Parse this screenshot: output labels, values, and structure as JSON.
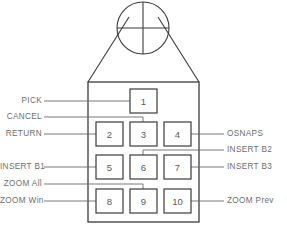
{
  "diagram": {
    "colors": {
      "outline": "#3b3b3b",
      "leader": "#6a6a6a",
      "text": "#6d6d6d",
      "key_text": "#5a5a5a",
      "background": "#ffffff"
    },
    "puck": {
      "crosshair_name": "crosshair-reticle"
    },
    "keys": [
      {
        "id": "key-1",
        "label": "1",
        "x": 130,
        "y": 89,
        "w": 27,
        "h": 24
      },
      {
        "id": "key-2",
        "label": "2",
        "x": 96,
        "y": 122,
        "w": 27,
        "h": 24
      },
      {
        "id": "key-3",
        "label": "3",
        "x": 130,
        "y": 122,
        "w": 27,
        "h": 24
      },
      {
        "id": "key-4",
        "label": "4",
        "x": 164,
        "y": 122,
        "w": 27,
        "h": 24
      },
      {
        "id": "key-5",
        "label": "5",
        "x": 96,
        "y": 155,
        "w": 27,
        "h": 24
      },
      {
        "id": "key-6",
        "label": "6",
        "x": 130,
        "y": 155,
        "w": 27,
        "h": 24
      },
      {
        "id": "key-7",
        "label": "7",
        "x": 164,
        "y": 155,
        "w": 27,
        "h": 24
      },
      {
        "id": "key-8",
        "label": "8",
        "x": 96,
        "y": 189,
        "w": 27,
        "h": 24
      },
      {
        "id": "key-9",
        "label": "9",
        "x": 130,
        "y": 189,
        "w": 27,
        "h": 24
      },
      {
        "id": "key-10",
        "label": "10",
        "x": 164,
        "y": 189,
        "w": 27,
        "h": 24
      }
    ],
    "callouts": [
      {
        "id": "callout-pick",
        "text": "PICK",
        "side": "left",
        "key": "1"
      },
      {
        "id": "callout-cancel",
        "text": "CANCEL",
        "side": "left",
        "key": "3"
      },
      {
        "id": "callout-return",
        "text": "RETURN",
        "side": "left",
        "key": "2"
      },
      {
        "id": "callout-insert-b1",
        "text": "INSERT  B1",
        "side": "left",
        "key": "5"
      },
      {
        "id": "callout-zoom-all",
        "text": "ZOOM  All",
        "side": "left",
        "key": "9"
      },
      {
        "id": "callout-zoom-win",
        "text": "ZOOM  Win",
        "side": "left",
        "key": "8"
      },
      {
        "id": "callout-osnaps",
        "text": "OSNAPS",
        "side": "right",
        "key": "4"
      },
      {
        "id": "callout-insert-b2",
        "text": "INSERT  B2",
        "side": "right",
        "key": "6"
      },
      {
        "id": "callout-insert-b3",
        "text": "INSERT  B3",
        "side": "right",
        "key": "7"
      },
      {
        "id": "callout-zoom-prev",
        "text": "ZOOM  Prev",
        "side": "right",
        "key": "10"
      }
    ]
  }
}
